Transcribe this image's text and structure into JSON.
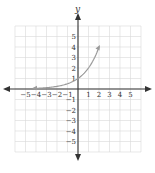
{
  "chart_data": {
    "type": "line",
    "title": "",
    "xlabel": "",
    "ylabel": "y",
    "xlim": [
      -6,
      6
    ],
    "ylim": [
      -6,
      6
    ],
    "grid": true,
    "x_ticks": [
      -5,
      -4,
      -3,
      -2,
      -1,
      1,
      2,
      3,
      4,
      5
    ],
    "y_ticks": [
      -5,
      -4,
      -3,
      -2,
      -1,
      1,
      2,
      3,
      4,
      5
    ],
    "series": [
      {
        "name": "exponential curve",
        "color": "#9a9a9a",
        "x": [
          -4,
          -3,
          -2,
          -1,
          0,
          1,
          2
        ],
        "y": [
          0.0625,
          0.125,
          0.25,
          0.5,
          1,
          2,
          4
        ]
      }
    ]
  },
  "labels": {
    "y_axis": "y"
  }
}
